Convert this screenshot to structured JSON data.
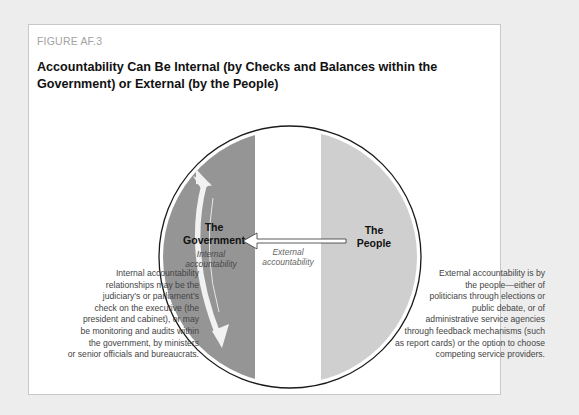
{
  "figure": {
    "label": "FIGURE AF.3",
    "title": "Accountability Can Be Internal (by Checks and Balances within the Government) or External (by the People)"
  },
  "diagram": {
    "government_label_line1": "The",
    "government_label_line2": "Government",
    "people_label_line1": "The",
    "people_label_line2": "People",
    "internal_label_line1": "Internal",
    "internal_label_line2": "accountability",
    "external_label_line1": "External",
    "external_label_line2": "accountability",
    "colors": {
      "government_segment": "#959595",
      "people_segment": "#cfcfcf",
      "circle_outline": "#1a1a1a",
      "arrow_fill": "#f2f2f2"
    }
  },
  "left_description": {
    "lines": [
      "Internal accountability",
      "relationships may be the",
      "judiciary’s or parliament’s",
      "check on the executive (the",
      "president and cabinet), or may",
      "be monitoring and audits within",
      "the government, by ministers",
      "or senior officials and bureaucrats."
    ]
  },
  "right_description": {
    "lines": [
      "External accountability is by",
      "the people—either of",
      "politicians through elections or",
      "public debate, or of",
      "administrative service agencies",
      "through feedback mechanisms (such",
      "as report cards) or the option to choose",
      "competing service providers."
    ]
  }
}
